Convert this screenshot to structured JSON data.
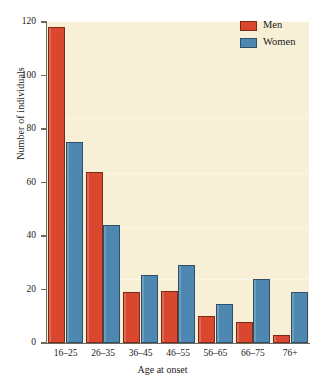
{
  "chart_data": {
    "type": "bar",
    "title": "",
    "xlabel": "Age at onset",
    "ylabel": "Number of individuals",
    "categories": [
      "16–25",
      "26–35",
      "36–45",
      "46–55",
      "56–65",
      "66–75",
      "76+"
    ],
    "series": [
      {
        "name": "Men",
        "color": "#d9482e",
        "values": [
          118,
          64,
          19,
          19.5,
          10,
          8,
          3
        ]
      },
      {
        "name": "Women",
        "color": "#4e87b0",
        "values": [
          75,
          44,
          25.5,
          29,
          14.5,
          24,
          19
        ]
      }
    ],
    "ylim": [
      0,
      120
    ],
    "yticks": [
      0,
      20,
      40,
      60,
      80,
      100,
      120
    ],
    "ytick_labels": [
      "0",
      "20",
      "40",
      "60",
      "80",
      "100",
      "120"
    ],
    "grid": false,
    "legend_position": "top-right",
    "plot_background": "#f7f0d6"
  },
  "legend": {
    "entries": [
      {
        "label": "Men"
      },
      {
        "label": "Women"
      }
    ]
  },
  "axes": {
    "y_title": "Number of individuals",
    "x_title": "Age at onset"
  }
}
